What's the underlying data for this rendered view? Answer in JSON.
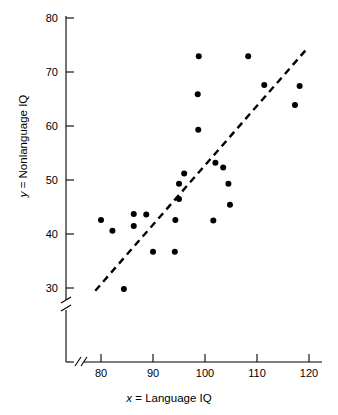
{
  "chart_data": {
    "type": "scatter",
    "title": "",
    "xlabel": "x = Language IQ",
    "xlabel_italic_prefix": "x",
    "xlabel_rest": " = Language IQ",
    "ylabel": "y = Nonlanguage IQ",
    "ylabel_italic_prefix": "y",
    "ylabel_rest": " = Nonlanguage IQ",
    "xlim": [
      78,
      122
    ],
    "ylim": [
      28,
      81
    ],
    "xticks": [
      80,
      90,
      100,
      110,
      120
    ],
    "yticks": [
      30,
      40,
      50,
      60,
      70,
      80
    ],
    "grid": false,
    "legend": null,
    "axis_break_x": true,
    "axis_break_y": true,
    "marker": "filled-circle",
    "marker_color": "#000000",
    "points": [
      {
        "x": 80.0,
        "y": 42.6
      },
      {
        "x": 82.2,
        "y": 40.6
      },
      {
        "x": 84.4,
        "y": 29.8
      },
      {
        "x": 86.3,
        "y": 43.7
      },
      {
        "x": 86.3,
        "y": 41.5
      },
      {
        "x": 88.7,
        "y": 43.6
      },
      {
        "x": 90.0,
        "y": 36.7
      },
      {
        "x": 94.2,
        "y": 36.7
      },
      {
        "x": 94.3,
        "y": 42.6
      },
      {
        "x": 95.0,
        "y": 46.5
      },
      {
        "x": 95.0,
        "y": 49.3
      },
      {
        "x": 96.0,
        "y": 51.2
      },
      {
        "x": 98.6,
        "y": 65.9
      },
      {
        "x": 98.7,
        "y": 59.3
      },
      {
        "x": 98.8,
        "y": 72.9
      },
      {
        "x": 101.6,
        "y": 42.5
      },
      {
        "x": 102.0,
        "y": 53.2
      },
      {
        "x": 103.5,
        "y": 52.3
      },
      {
        "x": 104.5,
        "y": 49.3
      },
      {
        "x": 104.8,
        "y": 45.4
      },
      {
        "x": 108.3,
        "y": 72.9
      },
      {
        "x": 111.4,
        "y": 67.6
      },
      {
        "x": 117.3,
        "y": 63.9
      },
      {
        "x": 118.2,
        "y": 67.4
      }
    ],
    "trend_line": {
      "style": "dashed",
      "color": "#000000",
      "x_start": 78.9,
      "y_start": 29.5,
      "x_end": 119.6,
      "y_end": 74.3
    }
  }
}
